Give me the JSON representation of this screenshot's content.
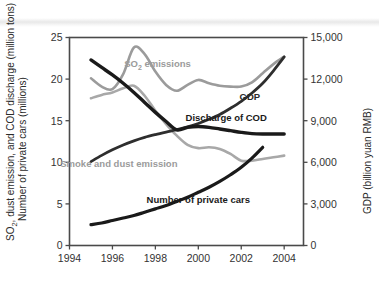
{
  "chart_data": {
    "type": "line",
    "title": "",
    "xlabel": "",
    "ylabel": "SO2, dust emission, and COD discharge (million tons)  Number of private cars (millions)",
    "ylabel_line1": "SO",
    "ylabel_sub1": "2",
    "ylabel_line1_rest": ", dust emission, and COD discharge (million tons)",
    "ylabel_line2": "Number of private cars (millions)",
    "y2label": "GDP (billion yuan RMB)",
    "xlim": [
      1994,
      2004.9
    ],
    "ylim": [
      0,
      25
    ],
    "y2lim": [
      0,
      15000
    ],
    "grid": false,
    "legend": "inline-annotations",
    "x_ticks": [
      "1994",
      "1996",
      "1998",
      "2000",
      "2002",
      "2004"
    ],
    "x_tick_values": [
      1994,
      1996,
      1998,
      2000,
      2002,
      2004
    ],
    "y_ticks": [
      "0",
      "5",
      "10",
      "15",
      "20",
      "25"
    ],
    "y_tick_values": [
      0,
      5,
      10,
      15,
      20,
      25
    ],
    "y2_ticks": [
      "0",
      "3,000",
      "6,000",
      "9,000",
      "12,000",
      "15,000"
    ],
    "y2_tick_values": [
      0,
      3000,
      6000,
      9000,
      12000,
      15000
    ],
    "series": [
      {
        "name": "SO2 emissions",
        "label": "SO",
        "label_sub": "2",
        "label_rest": " emissions",
        "axis": "left",
        "color": "#9b9b9b",
        "width": 2.6,
        "x": [
          1995,
          1995.5,
          1996,
          1996.5,
          1997,
          1997.5,
          1998,
          1998.5,
          1999,
          1999.5,
          2000,
          2000.5,
          2001,
          2001.5,
          2002,
          2002.5,
          2003,
          2003.5,
          2004
        ],
        "values": [
          20.1,
          19.1,
          18.8,
          20.6,
          23.8,
          23.0,
          20.9,
          19.3,
          18.6,
          19.3,
          19.9,
          19.5,
          19.2,
          19.1,
          19.1,
          19.6,
          20.7,
          21.8,
          22.7
        ]
      },
      {
        "name": "Smoke and dust emission",
        "label": "Smoke and dust emission",
        "axis": "left",
        "color": "#a8a8a8",
        "width": 2.6,
        "x": [
          1995,
          1995.5,
          1996,
          1996.5,
          1997,
          1997.5,
          1998,
          1998.5,
          1999,
          1999.5,
          2000,
          2000.5,
          2001,
          2001.5,
          2002,
          2002.5,
          2003,
          2003.5,
          2004
        ],
        "values": [
          17.7,
          18.1,
          18.4,
          18.9,
          19.2,
          18.0,
          16.2,
          14.6,
          13.2,
          12.1,
          11.7,
          11.8,
          11.6,
          11.0,
          10.2,
          10.2,
          10.4,
          10.6,
          10.8
        ]
      },
      {
        "name": "Discharge of COD",
        "label": "Discharge of COD",
        "axis": "left",
        "color": "#1a1a1a",
        "width": 3.4,
        "x": [
          1995,
          1995.5,
          1996,
          1996.5,
          1997,
          1997.5,
          1998,
          1998.5,
          1999,
          1999.5,
          2000,
          2000.5,
          2001,
          2001.5,
          2002,
          2002.5,
          2003,
          2003.5,
          2004
        ],
        "values": [
          22.3,
          21.4,
          20.5,
          19.5,
          18.4,
          17.2,
          16.0,
          14.9,
          13.9,
          14.2,
          14.3,
          14.2,
          14.0,
          13.8,
          13.6,
          13.45,
          13.4,
          13.4,
          13.4
        ]
      },
      {
        "name": "GDP",
        "label": "GDP",
        "axis": "right",
        "color": "#2e2e2e",
        "width": 2.8,
        "x": [
          1995,
          1995.5,
          1996,
          1996.5,
          1997,
          1997.5,
          1998,
          1998.5,
          1999,
          1999.5,
          2000,
          2000.5,
          2001,
          2001.5,
          2002,
          2002.5,
          2003,
          2003.5,
          2004
        ],
        "values": [
          6050,
          6500,
          6900,
          7250,
          7550,
          7800,
          8000,
          8180,
          8350,
          8550,
          8800,
          9100,
          9450,
          9900,
          10400,
          11000,
          11700,
          12600,
          13600
        ],
        "values_left_scale": [
          10.1,
          10.8,
          11.5,
          12.1,
          12.6,
          13.0,
          13.3,
          13.6,
          13.9,
          14.3,
          14.7,
          15.2,
          15.8,
          16.5,
          17.3,
          18.3,
          19.5,
          21.0,
          22.7
        ]
      },
      {
        "name": "Number of private cars",
        "label": "Number of private cars",
        "axis": "left",
        "color": "#1a1a1a",
        "width": 3.2,
        "x": [
          1995,
          1995.5,
          1996,
          1996.5,
          1997,
          1997.5,
          1998,
          1998.5,
          1999,
          1999.5,
          2000,
          2000.5,
          2001,
          2001.5,
          2002,
          2002.5,
          2003
        ],
        "values": [
          2.5,
          2.7,
          3.0,
          3.3,
          3.6,
          4.0,
          4.4,
          4.8,
          5.3,
          5.8,
          6.4,
          7.0,
          7.7,
          8.5,
          9.4,
          10.5,
          11.8
        ]
      }
    ],
    "annotations": [
      {
        "name": "so2-emissions-label",
        "text": "SO2 emissions",
        "x": 1998.1,
        "y": 21.4
      },
      {
        "name": "gdp-label",
        "text": "GDP",
        "x": 2002.4,
        "y": 17.5
      },
      {
        "name": "discharge-of-cod-label",
        "text": "Discharge of COD",
        "x": 2001.3,
        "y": 15.0
      },
      {
        "name": "smoke-and-dust-emission-label",
        "text": "Smoke and dust emission",
        "x": 1996.3,
        "y": 9.4
      },
      {
        "name": "number-of-private-cars-label",
        "text": "Number of private cars",
        "x": 2000.0,
        "y": 5.1
      }
    ]
  }
}
